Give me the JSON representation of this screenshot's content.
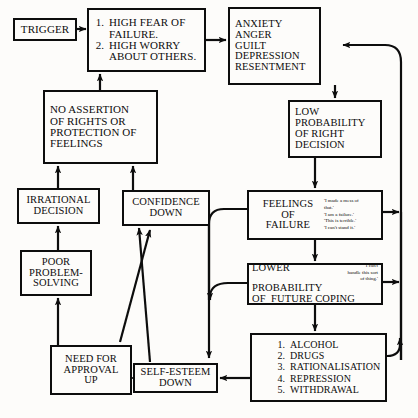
{
  "diagram": {
    "colors": {
      "ink": "#0d0d0d",
      "paper": "#fdfcfa"
    },
    "nodes": {
      "trigger": {
        "label": "TRIGGER"
      },
      "high_fear": {
        "items": [
          {
            "num": "1.",
            "text": "HIGH FEAR OF\nFAILURE."
          },
          {
            "num": "2.",
            "text": "HIGH WORRY\nABOUT OTHERS."
          }
        ]
      },
      "emotions": {
        "label": "ANXIETY\nANGER\nGUILT\nDEPRESSION\nRESENTMENT"
      },
      "no_assertion": {
        "label": "NO ASSERTION\nOF RIGHTS OR\nPROTECTION OF\nFEELINGS"
      },
      "low_probability": {
        "label": "LOW\nPROBABILITY\nOF RIGHT\nDECISION"
      },
      "irrational_decision": {
        "label": "IRRATIONAL\nDECISION"
      },
      "confidence_down": {
        "label": "CONFIDENCE\nDOWN"
      },
      "feelings_of_failure": {
        "label": "FEELINGS\nOF\nFAILURE",
        "quote": "'I made a mess of\nthat.'\n'I am a failure.'\n'This is terrible.'\n'I can't stand it.'"
      },
      "poor_problem_solving": {
        "label": "POOR\nPROBLEM-\nSOLVING"
      },
      "lower_probability": {
        "line1": "LOWER",
        "line2": "PROBABILITY",
        "line3": "OF  FUTURE COPING",
        "quote": "'I can't\nhandle this sort\nof thing.'"
      },
      "need_for_approval": {
        "label": "NEED FOR\nAPPROVAL\nUP"
      },
      "self_esteem_down": {
        "label": "SELF-ESTEEM\nDOWN"
      },
      "coping_list": {
        "items": [
          {
            "num": "1.",
            "text": "ALCOHOL"
          },
          {
            "num": "2.",
            "text": "DRUGS"
          },
          {
            "num": "3.",
            "text": "RATIONALISATION"
          },
          {
            "num": "4.",
            "text": "REPRESSION"
          },
          {
            "num": "5.",
            "text": "WITHDRAWAL"
          }
        ]
      }
    }
  }
}
